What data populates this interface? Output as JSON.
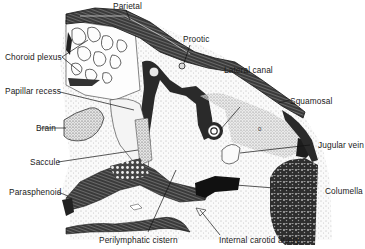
{
  "figure": {
    "labels": {
      "parietal": "Parietal",
      "prootic": "Prootic",
      "choroid_plexus": "Choroid plexus",
      "lateral_canal": "Lateral canal",
      "papillar_recess": "Papillar recess",
      "squamosal": "Squamosal",
      "brain": "Brain",
      "jugular_vein": "Jugular vein",
      "saccule": "Saccule",
      "parasphenoid": "Parasphenoid",
      "columella": "Columella",
      "perilymphatic_cistern": "Perilymphatic cistern",
      "internal_carotid_artery": "Internal carotid artery",
      "inner_mark": "0"
    },
    "colors": {
      "ink": "#1a1a1a",
      "bone_dark": "#2b2b2b",
      "bone_mid": "#555555",
      "stipple_bg": "#f2f2f2",
      "paper": "#ffffff"
    }
  }
}
